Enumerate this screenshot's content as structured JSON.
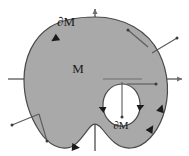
{
  "figure": {
    "type": "manifold-with-boundary-diagram",
    "title": "",
    "labels": {
      "outer_boundary": "∂M",
      "interior": "M",
      "hole_boundary": "∂M"
    },
    "colors": {
      "region_fill": "#a9a9a9",
      "region_stroke": "#4a4a4a",
      "axis": "#6e6e6e",
      "normal_vector": "#5a5a5a",
      "orientation_arrow": "#1a1a1a",
      "hole_fill": "#ffffff",
      "label_text": "#1a1a1a",
      "background": "#ffffff"
    },
    "axes": {
      "x_axis": {
        "from_x": 8,
        "to_x": 184,
        "y": 79,
        "arrow": "right"
      },
      "y_axis": {
        "x": 95,
        "from_y": 150,
        "to_y": 6,
        "arrow": "up"
      }
    },
    "label_positions": {
      "outer_boundary": {
        "x": 66,
        "y": 26
      },
      "interior": {
        "x": 78,
        "y": 73
      },
      "hole_boundary": {
        "x": 120,
        "y": 127
      }
    },
    "normal_vectors": [
      {
        "id": "normal-upper-right-1",
        "x1": 148,
        "y1": 47,
        "x2": 128,
        "y2": 30
      },
      {
        "id": "normal-upper-right-2",
        "x1": 152,
        "y1": 53,
        "x2": 177,
        "y2": 38
      },
      {
        "id": "normal-lower-left-1",
        "x1": 38,
        "y1": 114,
        "x2": 12,
        "y2": 125
      },
      {
        "id": "normal-lower-left-2",
        "x1": 38,
        "y1": 114,
        "x2": 46,
        "y2": 140
      },
      {
        "id": "normal-hole-right",
        "x1": 127,
        "y1": 87,
        "x2": 156,
        "y2": 87
      },
      {
        "id": "normal-hole-down",
        "x1": 122,
        "y1": 83,
        "x2": 122,
        "y2": 118
      }
    ],
    "orientation_arrows": [
      {
        "id": "orientation-outer-topleft",
        "x": 58,
        "y": 37,
        "angle": 145
      },
      {
        "id": "orientation-outer-bottom",
        "x": 73,
        "y": 146,
        "angle": 10
      },
      {
        "id": "orientation-outer-bottomright",
        "x": 150,
        "y": 130,
        "angle": -55
      },
      {
        "id": "orientation-outer-right",
        "x": 158,
        "y": 114,
        "angle": -68
      },
      {
        "id": "orientation-hole-left",
        "x": 108,
        "y": 110,
        "angle": 200
      },
      {
        "id": "orientation-hole-right",
        "x": 136,
        "y": 110,
        "angle": -20
      }
    ]
  }
}
